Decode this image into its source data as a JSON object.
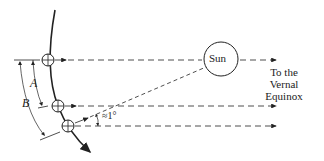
{
  "diagram": {
    "labels": {
      "sun": "Sun",
      "vernal_equinox": [
        "To the",
        "Vernal",
        "Equinox"
      ],
      "arc_a": "A",
      "arc_b": "B",
      "angle": "≈1°"
    },
    "colors": {
      "line": "#222222",
      "background": "#ffffff"
    }
  }
}
